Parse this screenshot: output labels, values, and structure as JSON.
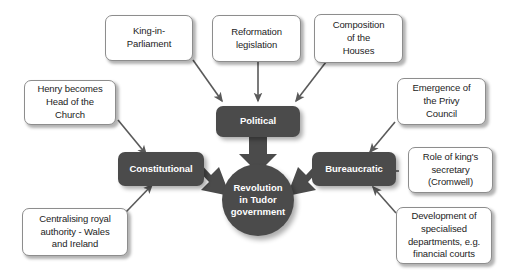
{
  "diagram": {
    "title": "Revolution in Tudor government",
    "type": "concept-map",
    "colors": {
      "node_dark": "#4b4b4b",
      "node_light": "#ffffff",
      "node_border": "#8d8d8d",
      "text_dark": "#1c1c1c",
      "text_light": "#ffffff",
      "arrow_thin": "#5a5a5a",
      "arrow_thick": "#4b4b4b",
      "background": "#ffffff"
    },
    "hub": {
      "label": "Revolution in Tudor government",
      "line1": "Revolution",
      "line2": "in Tudor",
      "line3": "government"
    },
    "categories": [
      {
        "id": "political",
        "label": "Political"
      },
      {
        "id": "constitutional",
        "label": "Constitutional"
      },
      {
        "id": "bureaucratic",
        "label": "Bureaucratic"
      }
    ],
    "factors": [
      {
        "id": "king-in-parliament",
        "label": "King-in-Parliament",
        "line1": "King-in-",
        "line2": "Parliament",
        "target": "political"
      },
      {
        "id": "reformation-legislation",
        "label": "Reformation legislation",
        "line1": "Reformation",
        "line2": "legislation",
        "target": "political"
      },
      {
        "id": "composition-of-the-houses",
        "label": "Composition of the Houses",
        "line1": "Composition",
        "line2": "of the",
        "line3": "Houses",
        "target": "political"
      },
      {
        "id": "henry-head-of-church",
        "label": "Henry becomes Head of the Church",
        "line1": "Henry becomes",
        "line2": "Head of the",
        "line3": "Church",
        "target": "constitutional"
      },
      {
        "id": "centralising-royal-authority",
        "label": "Centralising royal authority - Wales and Ireland",
        "line1": "Centralising royal",
        "line2": "authority - Wales",
        "line3": "and Ireland",
        "target": "constitutional"
      },
      {
        "id": "emergence-privy-council",
        "label": "Emergence of the Privy Council",
        "line1": "Emergence of",
        "line2": "the Privy",
        "line3": "Council",
        "target": "bureaucratic"
      },
      {
        "id": "role-of-kings-secretary",
        "label": "Role of king's secretary (Cromwell)",
        "line1": "Role of king's",
        "line2": "secretary",
        "line3": "(Cromwell)",
        "target": "bureaucratic"
      },
      {
        "id": "development-specialised-departments",
        "label": "Development of specialised departments, e.g. financial courts",
        "line1": "Development of",
        "line2": "specialised",
        "line3": "departments, e.g.",
        "line4": "financial courts",
        "target": "bureaucratic"
      }
    ]
  }
}
